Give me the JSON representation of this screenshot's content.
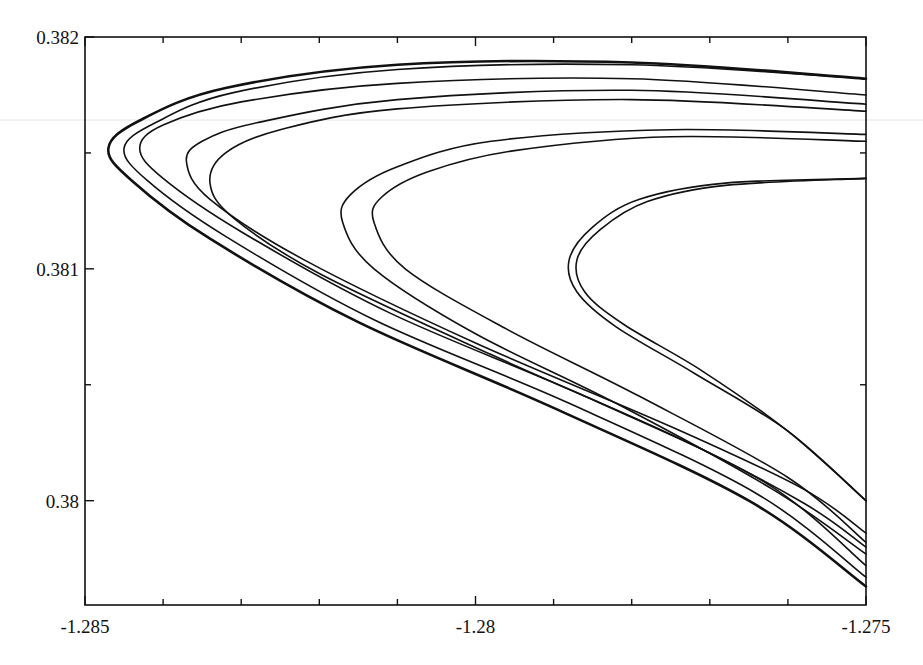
{
  "chart_data": {
    "type": "line",
    "title": "",
    "xlabel": "",
    "ylabel": "",
    "xlim": [
      -1.285,
      -1.275
    ],
    "ylim": [
      0.37955,
      0.382
    ],
    "grid": false,
    "legend": null,
    "x_ticks": [
      {
        "value": -1.285,
        "label": "-1.285"
      },
      {
        "value": -1.28,
        "label": "-1.28"
      },
      {
        "value": -1.275,
        "label": "-1.275"
      }
    ],
    "x_minor_ticks": [
      -1.284,
      -1.283,
      -1.282,
      -1.281,
      -1.279,
      -1.278,
      -1.277,
      -1.276
    ],
    "y_ticks": [
      {
        "value": 0.382,
        "label": "0.382"
      },
      {
        "value": 0.381,
        "label": "0.381"
      },
      {
        "value": 0.38,
        "label": "0.38"
      }
    ],
    "y_minor_ticks": [
      0.3815,
      0.3805
    ],
    "series": [
      {
        "name": "curve-1",
        "stroke_width": 2.6,
        "top_right": [
          -1.275,
          0.38182
        ],
        "tip": [
          -1.2847,
          0.38152
        ],
        "bottom_right": [
          -1.275,
          0.37963
        ],
        "points": [
          [
            -1.275,
            0.38182
          ],
          [
            -1.278,
            0.38189
          ],
          [
            -1.281,
            0.38188
          ],
          [
            -1.2832,
            0.38178
          ],
          [
            -1.2843,
            0.38164
          ],
          [
            -1.2847,
            0.38152
          ],
          [
            -1.2844,
            0.38138
          ],
          [
            -1.2834,
            0.38113
          ],
          [
            -1.2815,
            0.38077
          ],
          [
            -1.279,
            0.3804
          ],
          [
            -1.2765,
            0.38
          ],
          [
            -1.275,
            0.37963
          ]
        ]
      },
      {
        "name": "curve-2",
        "stroke_width": 1.6,
        "top_right": [
          -1.275,
          0.38182
        ],
        "tip": [
          -1.2845,
          0.38152
        ],
        "bottom_right": [
          -1.275,
          0.37967
        ],
        "points": [
          [
            -1.275,
            0.38182
          ],
          [
            -1.278,
            0.38188
          ],
          [
            -1.281,
            0.38186
          ],
          [
            -1.2831,
            0.38176
          ],
          [
            -1.2841,
            0.38163
          ],
          [
            -1.2845,
            0.38152
          ],
          [
            -1.2842,
            0.38138
          ],
          [
            -1.2832,
            0.38114
          ],
          [
            -1.2813,
            0.38078
          ],
          [
            -1.2788,
            0.38042
          ],
          [
            -1.2764,
            0.38003
          ],
          [
            -1.275,
            0.37967
          ]
        ]
      },
      {
        "name": "curve-3",
        "stroke_width": 1.6,
        "top_right": [
          -1.275,
          0.38175
        ],
        "tip": [
          -1.2843,
          0.38152
        ],
        "bottom_right": [
          -1.275,
          0.37972
        ],
        "points": [
          [
            -1.275,
            0.38175
          ],
          [
            -1.278,
            0.38182
          ],
          [
            -1.281,
            0.3818
          ],
          [
            -1.283,
            0.38172
          ],
          [
            -1.284,
            0.38162
          ],
          [
            -1.2843,
            0.38152
          ],
          [
            -1.284,
            0.38139
          ],
          [
            -1.283,
            0.38116
          ],
          [
            -1.2811,
            0.38081
          ],
          [
            -1.2786,
            0.38045
          ],
          [
            -1.2763,
            0.38008
          ],
          [
            -1.275,
            0.37972
          ]
        ]
      },
      {
        "name": "curve-4",
        "stroke_width": 1.6,
        "top_right": [
          -1.275,
          0.38171
        ],
        "tip": [
          -1.2837,
          0.38146
        ],
        "bottom_right": [
          -1.275,
          0.37986
        ],
        "points": [
          [
            -1.275,
            0.38171
          ],
          [
            -1.278,
            0.38177
          ],
          [
            -1.281,
            0.38173
          ],
          [
            -1.2828,
            0.38163
          ],
          [
            -1.2835,
            0.38155
          ],
          [
            -1.2837,
            0.38146
          ],
          [
            -1.2834,
            0.3813
          ],
          [
            -1.2822,
            0.38104
          ],
          [
            -1.28,
            0.38068
          ],
          [
            -1.2775,
            0.38032
          ],
          [
            -1.2758,
            0.38005
          ],
          [
            -1.275,
            0.37986
          ]
        ]
      },
      {
        "name": "curve-5",
        "stroke_width": 1.6,
        "top_right": [
          -1.275,
          0.38168
        ],
        "tip": [
          -1.2834,
          0.38137
        ],
        "bottom_right": [
          -1.275,
          0.3798
        ],
        "points": [
          [
            -1.275,
            0.38168
          ],
          [
            -1.278,
            0.38173
          ],
          [
            -1.281,
            0.38169
          ],
          [
            -1.2825,
            0.3816
          ],
          [
            -1.2832,
            0.3815
          ],
          [
            -1.2834,
            0.38137
          ],
          [
            -1.2831,
            0.38122
          ],
          [
            -1.282,
            0.38098
          ],
          [
            -1.2798,
            0.38063
          ],
          [
            -1.2774,
            0.38027
          ],
          [
            -1.2758,
            0.37999
          ],
          [
            -1.275,
            0.3798
          ]
        ]
      },
      {
        "name": "curve-6",
        "stroke_width": 1.6,
        "top_right": [
          -1.275,
          0.38158
        ],
        "tip": [
          -1.2817,
          0.3812
        ],
        "bottom_right": [
          -1.275,
          0.37977
        ],
        "points": [
          [
            -1.275,
            0.38158
          ],
          [
            -1.2775,
            0.3816
          ],
          [
            -1.2798,
            0.38155
          ],
          [
            -1.281,
            0.38144
          ],
          [
            -1.2816,
            0.38132
          ],
          [
            -1.2817,
            0.3812
          ],
          [
            -1.2813,
            0.381
          ],
          [
            -1.28,
            0.38072
          ],
          [
            -1.2782,
            0.38042
          ],
          [
            -1.2762,
            0.38005
          ],
          [
            -1.275,
            0.37977
          ]
        ]
      },
      {
        "name": "curve-7",
        "stroke_width": 1.6,
        "top_right": [
          -1.275,
          0.38155
        ],
        "tip": [
          -1.2813,
          0.3812
        ],
        "bottom_right": [
          -1.275,
          0.37982
        ],
        "points": [
          [
            -1.275,
            0.38155
          ],
          [
            -1.2775,
            0.38157
          ],
          [
            -1.2795,
            0.38151
          ],
          [
            -1.2806,
            0.38142
          ],
          [
            -1.2812,
            0.38131
          ],
          [
            -1.2813,
            0.3812
          ],
          [
            -1.2809,
            0.381
          ],
          [
            -1.2796,
            0.38074
          ],
          [
            -1.2779,
            0.38045
          ],
          [
            -1.276,
            0.3801
          ],
          [
            -1.275,
            0.37982
          ]
        ]
      },
      {
        "name": "curve-8",
        "stroke_width": 1.6,
        "top_right": [
          -1.275,
          0.38139
        ],
        "tip": [
          -1.2788,
          0.381
        ],
        "bottom_right": [
          -1.275,
          0.38
        ],
        "points": [
          [
            -1.275,
            0.38139
          ],
          [
            -1.2768,
            0.38137
          ],
          [
            -1.2779,
            0.3813
          ],
          [
            -1.2785,
            0.38118
          ],
          [
            -1.2788,
            0.38104
          ],
          [
            -1.2787,
            0.3809
          ],
          [
            -1.2782,
            0.38075
          ],
          [
            -1.2772,
            0.38055
          ],
          [
            -1.276,
            0.3803
          ],
          [
            -1.275,
            0.38
          ]
        ]
      },
      {
        "name": "curve-9",
        "stroke_width": 1.6,
        "top_right": [
          -1.275,
          0.38139
        ],
        "tip": [
          -1.2787,
          0.381
        ],
        "bottom_right": [
          -1.275,
          0.38
        ],
        "points": [
          [
            -1.275,
            0.38139
          ],
          [
            -1.2768,
            0.38136
          ],
          [
            -1.2778,
            0.38129
          ],
          [
            -1.2784,
            0.38117
          ],
          [
            -1.2787,
            0.38104
          ],
          [
            -1.2786,
            0.3809
          ],
          [
            -1.2781,
            0.38076
          ],
          [
            -1.2771,
            0.38056
          ],
          [
            -1.276,
            0.3803
          ],
          [
            -1.275,
            0.38
          ]
        ]
      }
    ]
  },
  "plot_area": {
    "left_px": 85,
    "right_px": 866,
    "top_px": 37,
    "bottom_px": 605
  }
}
